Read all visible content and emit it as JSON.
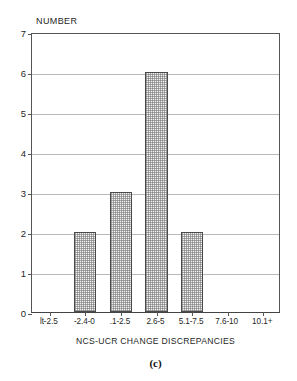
{
  "chart_data": {
    "type": "bar",
    "title": "",
    "subtitle": "",
    "xlabel": "NCS-UCR CHANGE DISCREPANCIES",
    "ylabel": "NUMBER",
    "categories": [
      "lt-2.5",
      "-2.4-0",
      ".1-2.5",
      "2.6-5",
      "5.1-7.5",
      "7.6-10",
      "10.1+"
    ],
    "values": [
      0,
      2,
      3,
      6,
      2,
      0,
      0
    ],
    "ylim": [
      0,
      7
    ],
    "ytick_labels": [
      "0",
      "1",
      "2",
      "3",
      "4",
      "5",
      "6",
      "7"
    ],
    "ytick_values": [
      0,
      1,
      2,
      3,
      4,
      5,
      6,
      7
    ],
    "grid": true,
    "grid_axis": "y",
    "legend": false,
    "legend_position": "none",
    "bar_fill": "#f2f2f2",
    "bar_edge": "#4a4a4a",
    "grid_color": "#b9b9b9",
    "axis_color": "#555555"
  },
  "caption": {
    "label": "(c)"
  }
}
